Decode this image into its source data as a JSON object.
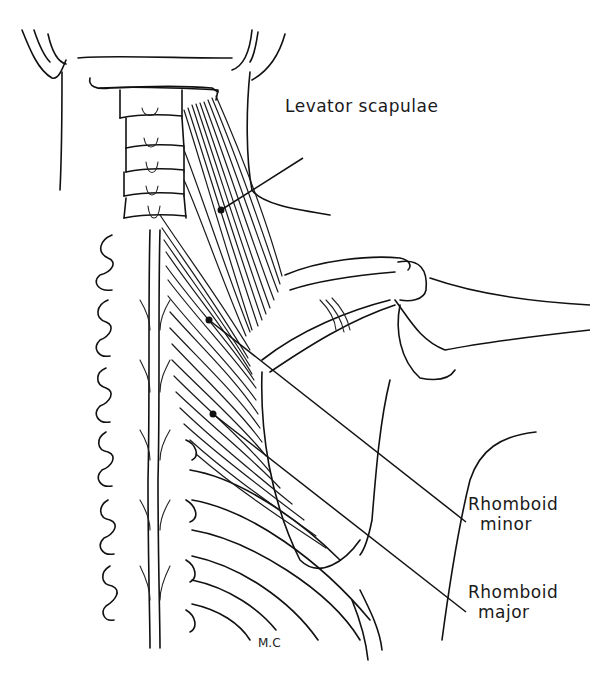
{
  "figure": {
    "labels": {
      "levator_scapulae": "Levator scapulae",
      "rhomboid_minor_line1": "Rhomboid",
      "rhomboid_minor_line2": "minor",
      "rhomboid_major_line1": "Rhomboid",
      "rhomboid_major_line2": "major"
    },
    "signature": "M.C",
    "colors": {
      "ink": "#111111",
      "background": "#ffffff"
    }
  }
}
